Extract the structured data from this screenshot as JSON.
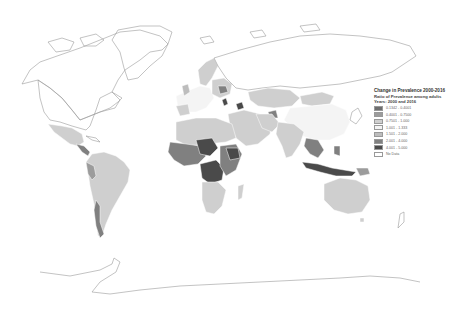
{
  "map": {
    "title": "Change in Prevalence 2000-2016",
    "subtitle": "Ratio of Prevalence among adults",
    "years_label": "Years: 2000 and 2016",
    "projection": "world choropleth (grayscale)",
    "legend": {
      "items": [
        {
          "label": "0.1342 - 0.4001",
          "color": "#6e6e6e"
        },
        {
          "label": "0.4001 - 0.7500",
          "color": "#9c9c9c"
        },
        {
          "label": "0.7501 - 1.000",
          "color": "#cfcfcf"
        },
        {
          "label": "1.001 - 1.333",
          "color": "#f4f4f4"
        },
        {
          "label": "1.501 - 2.000",
          "color": "#bdbdbd"
        },
        {
          "label": "2.001 - 4.000",
          "color": "#808080"
        },
        {
          "label": "4.001 - 5.000",
          "color": "#4a4a4a"
        },
        {
          "label": "No Data",
          "color": "#ffffff"
        }
      ]
    },
    "regions": [
      {
        "name": "North America (Canada, USA)",
        "class": "No Data"
      },
      {
        "name": "Greenland",
        "class": "No Data"
      },
      {
        "name": "Mexico",
        "class": "0.7501 - 1.000"
      },
      {
        "name": "Central America",
        "class": "2.001 - 4.000"
      },
      {
        "name": "South America",
        "class": "0.7501 - 1.000"
      },
      {
        "name": "Chile/Argentina south",
        "class": "2.001 - 4.000"
      },
      {
        "name": "Western Europe",
        "class": "1.001 - 1.333"
      },
      {
        "name": "Scandinavia",
        "class": "0.7501 - 1.000"
      },
      {
        "name": "Belarus",
        "class": "2.001 - 4.000"
      },
      {
        "name": "Caucasus",
        "class": "4.001 - 5.000"
      },
      {
        "name": "Russia",
        "class": "No Data"
      },
      {
        "name": "Kazakhstan",
        "class": "0.7501 - 1.000"
      },
      {
        "name": "Mongolia",
        "class": "0.7501 - 1.000"
      },
      {
        "name": "China",
        "class": "1.001 - 1.333"
      },
      {
        "name": "Middle East",
        "class": "0.7501 - 1.000"
      },
      {
        "name": "India",
        "class": "0.7501 - 1.000"
      },
      {
        "name": "Southeast Asia",
        "class": "2.001 - 4.000"
      },
      {
        "name": "Indonesia",
        "class": "4.001 - 5.000"
      },
      {
        "name": "North Africa",
        "class": "0.7501 - 1.000"
      },
      {
        "name": "West Africa",
        "class": "2.001 - 4.000"
      },
      {
        "name": "Central Africa",
        "class": "4.001 - 5.000"
      },
      {
        "name": "East Africa",
        "class": "2.001 - 4.000"
      },
      {
        "name": "Southern Africa",
        "class": "0.7501 - 1.000"
      },
      {
        "name": "Madagascar",
        "class": "0.7501 - 1.000"
      },
      {
        "name": "Australia",
        "class": "0.7501 - 1.000"
      },
      {
        "name": "Antarctica",
        "class": "No Data"
      }
    ]
  }
}
